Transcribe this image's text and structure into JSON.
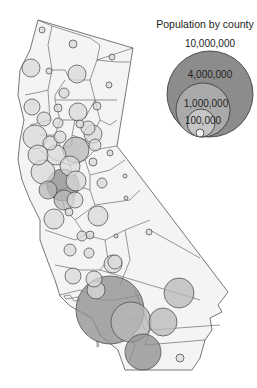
{
  "legend": {
    "title": "Population by county",
    "items": [
      {
        "label": "10,000,000",
        "cx": 210,
        "cy": 94,
        "r": 43,
        "fill": "#8c8c8c",
        "label_x": 210,
        "label_y": 38
      },
      {
        "label": "4,000,000",
        "cx": 203,
        "cy": 110,
        "r": 27,
        "fill": "#aaaaaa",
        "label_x": 210,
        "label_y": 69
      },
      {
        "label": "1,000,000",
        "cx": 201,
        "cy": 123,
        "r": 14,
        "fill": "#c6c6c6",
        "label_x": 206,
        "label_y": 98
      },
      {
        "label": "100,000",
        "cx": 200,
        "cy": 133,
        "r": 4,
        "fill": "#f2f2f2",
        "label_x": 203,
        "label_y": 115
      }
    ]
  },
  "colors": {
    "county_fill": "#f4f4f4",
    "county_stroke": "#555555",
    "bubble_light": "#d9d9d9",
    "bubble_mid": "#b8b8b8",
    "bubble_dark": "#8c8c8c",
    "bubble_stroke": "#444444"
  },
  "state_outline": "M38,20 L133,48 L117,146 L228,292 L222,300 L218,305 L222,312 L210,318 L212,330 L205,340 L200,358 L192,370 L125,370 L118,350 L100,335 L92,318 L70,306 L60,296 L55,280 L48,262 L40,240 L40,220 L30,200 L22,180 L18,160 L20,140 L24,120 L18,95 L20,70 L30,50 L38,20 Z",
  "county_lines": [
    "M38,20 L52,26 L48,45 L52,70",
    "M52,26 L90,38 L100,45 L97,60 L133,48",
    "M97,60 L90,80 L70,80 L65,70 L52,70",
    "M52,70 L48,90 L40,92 L25,95",
    "M97,60 L117,62 L130,62",
    "M90,80 L95,100 L117,100",
    "M65,80 L55,95 L55,100 L70,100 L95,100",
    "M48,90 L50,120 L30,125",
    "M55,100 L60,120 L75,120 L85,118 L95,100",
    "M95,100 L100,120 L110,125 L117,120",
    "M60,120 L55,135 L40,135",
    "M75,120 L72,135 L85,140 L95,130 L100,120",
    "M85,140 L95,150 L105,148 L117,146",
    "M55,135 L62,150 L72,145 L72,135",
    "M62,150 L70,165 L85,160 L95,150",
    "M40,150 L55,160 L70,165",
    "M85,160 L90,175 L110,170 L125,160",
    "M70,165 L75,185 L90,190 L95,205 L130,200 L140,190",
    "M90,175 L90,190",
    "M75,185 L60,190 L45,185",
    "M60,190 L65,210 L75,220 L95,205",
    "M75,220 L85,235 L105,240 L125,230 L150,220",
    "M105,240 L108,260 L100,270",
    "M125,230 L130,260 L120,285",
    "M45,230 L75,240 L85,235",
    "M55,265 L80,270 L100,270",
    "M60,295 L80,290 L100,300",
    "M100,270 L200,300",
    "M135,290 L150,330 L145,345",
    "M100,300 L115,300 L140,295",
    "M150,330 L220,325",
    "M145,345 L205,340",
    "M120,330 L135,345 L130,360",
    "M115,310 L125,320 L140,318 L145,330",
    "M150,230 L200,258"
  ],
  "bubbles": [
    {
      "cx": 42,
      "cy": 30,
      "r": 3,
      "shade": "light"
    },
    {
      "cx": 73,
      "cy": 44,
      "r": 4,
      "shade": "light"
    },
    {
      "cx": 112,
      "cy": 57,
      "r": 3,
      "shade": "light"
    },
    {
      "cx": 31,
      "cy": 68,
      "r": 9,
      "shade": "light"
    },
    {
      "cx": 49,
      "cy": 71,
      "r": 3,
      "shade": "light"
    },
    {
      "cx": 77,
      "cy": 74,
      "r": 9,
      "shade": "light"
    },
    {
      "cx": 109,
      "cy": 85,
      "r": 3,
      "shade": "light"
    },
    {
      "cx": 64,
      "cy": 93,
      "r": 5,
      "shade": "light"
    },
    {
      "cx": 32,
      "cy": 107,
      "r": 8,
      "shade": "light"
    },
    {
      "cx": 58,
      "cy": 108,
      "r": 4,
      "shade": "light"
    },
    {
      "cx": 78,
      "cy": 112,
      "r": 9,
      "shade": "light"
    },
    {
      "cx": 97,
      "cy": 106,
      "r": 4,
      "shade": "light"
    },
    {
      "cx": 44,
      "cy": 119,
      "r": 7,
      "shade": "light"
    },
    {
      "cx": 58,
      "cy": 123,
      "r": 5,
      "shade": "light"
    },
    {
      "cx": 80,
      "cy": 124,
      "r": 4,
      "shade": "light"
    },
    {
      "cx": 88,
      "cy": 128,
      "r": 7,
      "shade": "light"
    },
    {
      "cx": 93,
      "cy": 134,
      "r": 9,
      "shade": "light"
    },
    {
      "cx": 35,
      "cy": 137,
      "r": 12,
      "shade": "light"
    },
    {
      "cx": 50,
      "cy": 143,
      "r": 7,
      "shade": "light"
    },
    {
      "cx": 60,
      "cy": 137,
      "r": 6,
      "shade": "light"
    },
    {
      "cx": 76,
      "cy": 150,
      "r": 13,
      "shade": "mid"
    },
    {
      "cx": 95,
      "cy": 145,
      "r": 6,
      "shade": "light"
    },
    {
      "cx": 56,
      "cy": 155,
      "r": 10,
      "shade": "light"
    },
    {
      "cx": 38,
      "cy": 155,
      "r": 10,
      "shade": "light"
    },
    {
      "cx": 110,
      "cy": 153,
      "r": 3,
      "shade": "light"
    },
    {
      "cx": 93,
      "cy": 162,
      "r": 4,
      "shade": "light"
    },
    {
      "cx": 43,
      "cy": 172,
      "r": 12,
      "shade": "light"
    },
    {
      "cx": 70,
      "cy": 166,
      "r": 10,
      "shade": "light"
    },
    {
      "cx": 63,
      "cy": 185,
      "r": 16,
      "shade": "dark"
    },
    {
      "cx": 48,
      "cy": 190,
      "r": 9,
      "shade": "mid"
    },
    {
      "cx": 64,
      "cy": 200,
      "r": 10,
      "shade": "mid"
    },
    {
      "cx": 76,
      "cy": 181,
      "r": 10,
      "shade": "light"
    },
    {
      "cx": 75,
      "cy": 200,
      "r": 8,
      "shade": "light"
    },
    {
      "cx": 102,
      "cy": 183,
      "r": 5,
      "shade": "light"
    },
    {
      "cx": 125,
      "cy": 176,
      "r": 2,
      "shade": "light"
    },
    {
      "cx": 126,
      "cy": 198,
      "r": 2,
      "shade": "light"
    },
    {
      "cx": 54,
      "cy": 219,
      "r": 10,
      "shade": "light"
    },
    {
      "cx": 69,
      "cy": 212,
      "r": 4,
      "shade": "light"
    },
    {
      "cx": 90,
      "cy": 235,
      "r": 4,
      "shade": "light"
    },
    {
      "cx": 98,
      "cy": 216,
      "r": 10,
      "shade": "light"
    },
    {
      "cx": 82,
      "cy": 236,
      "r": 5,
      "shade": "light"
    },
    {
      "cx": 70,
      "cy": 250,
      "r": 6,
      "shade": "light"
    },
    {
      "cx": 116,
      "cy": 236,
      "r": 2,
      "shade": "light"
    },
    {
      "cx": 89,
      "cy": 253,
      "r": 5,
      "shade": "light"
    },
    {
      "cx": 115,
      "cy": 262,
      "r": 7,
      "shade": "light"
    },
    {
      "cx": 149,
      "cy": 232,
      "r": 3,
      "shade": "light"
    },
    {
      "cx": 73,
      "cy": 276,
      "r": 8,
      "shade": "light"
    },
    {
      "cx": 110,
      "cy": 310,
      "r": 34,
      "shade": "dark"
    },
    {
      "cx": 113,
      "cy": 264,
      "r": 9,
      "shade": "light"
    },
    {
      "cx": 94,
      "cy": 279,
      "r": 8,
      "shade": "light"
    },
    {
      "cx": 96,
      "cy": 290,
      "r": 9,
      "shade": "light"
    },
    {
      "cx": 131,
      "cy": 322,
      "r": 20,
      "shade": "mid"
    },
    {
      "cx": 143,
      "cy": 352,
      "r": 18,
      "shade": "dark"
    },
    {
      "cx": 163,
      "cy": 322,
      "r": 14,
      "shade": "mid"
    },
    {
      "cx": 179,
      "cy": 293,
      "r": 15,
      "shade": "mid"
    },
    {
      "cx": 180,
      "cy": 358,
      "r": 4,
      "shade": "light"
    }
  ],
  "islands": [
    "M64,296 L70,295 L72,298 L66,299 Z",
    "M72,298 L78,297 L80,300 L74,301 Z",
    "M97,340 L99,346 L97,347 Z"
  ]
}
